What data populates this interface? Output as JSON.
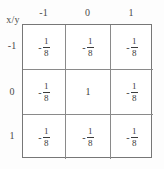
{
  "document": {
    "kind": "math-table",
    "corner_label": "x/y",
    "ink_color": "#3c3c3c",
    "rule_color": "#8a8a8a",
    "paper_color": "#fdfdfd"
  },
  "table": {
    "column_headers": [
      "-1",
      "0",
      "1"
    ],
    "row_headers": [
      "-1",
      "0",
      "1"
    ],
    "cells": [
      [
        {
          "text": "-1/8",
          "sign": "-",
          "numerator": "1",
          "denominator": "8",
          "is_fraction": true
        },
        {
          "text": "-1/8",
          "sign": "-",
          "numerator": "1",
          "denominator": "8",
          "is_fraction": true
        },
        {
          "text": "-1/8",
          "sign": "-",
          "numerator": "1",
          "denominator": "8",
          "is_fraction": true
        }
      ],
      [
        {
          "text": "-1/8",
          "sign": "-",
          "numerator": "1",
          "denominator": "8",
          "is_fraction": true
        },
        {
          "text": "1",
          "sign": "",
          "numerator": "1",
          "denominator": "",
          "is_fraction": false
        },
        {
          "text": "-1/8",
          "sign": "-",
          "numerator": "1",
          "denominator": "8",
          "is_fraction": true
        }
      ],
      [
        {
          "text": "-1/8",
          "sign": "-",
          "numerator": "1",
          "denominator": "8",
          "is_fraction": true
        },
        {
          "text": "-1/8",
          "sign": "-",
          "numerator": "1",
          "denominator": "8",
          "is_fraction": true
        },
        {
          "text": "-1/8",
          "sign": "-",
          "numerator": "1",
          "denominator": "8",
          "is_fraction": true
        }
      ]
    ]
  },
  "chart_data": {
    "type": "table",
    "title": "",
    "xlabel": "x",
    "ylabel": "y",
    "corner_label": "x/y",
    "categories": [
      "-1",
      "0",
      "1"
    ],
    "row_categories": [
      "-1",
      "0",
      "1"
    ],
    "values": [
      [
        -0.125,
        -0.125,
        -0.125
      ],
      [
        -0.125,
        1,
        -0.125
      ],
      [
        -0.125,
        -0.125,
        -0.125
      ]
    ],
    "value_labels": [
      [
        "-1/8",
        "-1/8",
        "-1/8"
      ],
      [
        "-1/8",
        "1",
        "-1/8"
      ],
      [
        "-1/8",
        "-1/8",
        "-1/8"
      ]
    ],
    "grid": true,
    "legend": "none"
  }
}
